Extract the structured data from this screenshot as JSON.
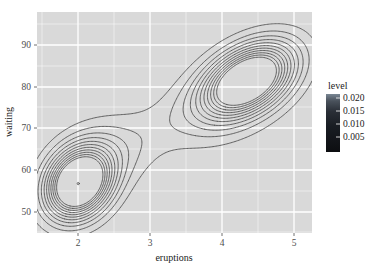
{
  "chart_data": {
    "type": "contour",
    "title": "",
    "xlabel": "eruptions",
    "ylabel": "waiting",
    "xlim": [
      1.45,
      5.25
    ],
    "ylim": [
      42.0,
      97.0
    ],
    "xticks": [
      2,
      3,
      4,
      5
    ],
    "xtick_labels": [
      "2",
      "3",
      "4",
      "5"
    ],
    "yticks": [
      50,
      60,
      70,
      80,
      90
    ],
    "ytick_labels": [
      "50",
      "60",
      "70",
      "80",
      "90"
    ],
    "grid": true,
    "panel_fill": "#d9d9d9",
    "grid_color": "#ffffff",
    "contour_color": "#4a4a4a",
    "legend": {
      "title": "level",
      "position": "right",
      "tick_values": [
        0.02,
        0.015,
        0.01,
        0.005
      ],
      "tick_labels": [
        "0.020",
        "0.015",
        "0.010",
        "0.005"
      ],
      "bar_top_color": "#6e7b8b",
      "bar_bottom_color": "#101013",
      "vmin": 0.0025,
      "vmax": 0.0225
    },
    "levels": [
      0.002,
      0.004,
      0.006,
      0.008,
      0.01,
      0.012,
      0.014,
      0.016,
      0.018,
      0.02,
      0.022
    ],
    "peaks": [
      {
        "name": "short-eruption-mode",
        "x": 2.02,
        "y": 54.0,
        "peak_density": 0.0228
      },
      {
        "name": "long-eruption-mode",
        "x": 4.35,
        "y": 80.0,
        "peak_density": 0.0231
      }
    ]
  },
  "axes": {
    "x": {
      "label": "eruptions",
      "tick_labels": [
        "2",
        "3",
        "4",
        "5"
      ]
    },
    "y": {
      "label": "waiting",
      "tick_labels": [
        "50",
        "60",
        "70",
        "80",
        "90"
      ]
    }
  },
  "legend": {
    "title": "level",
    "labels": [
      "0.020",
      "0.015",
      "0.010",
      "0.005"
    ]
  }
}
